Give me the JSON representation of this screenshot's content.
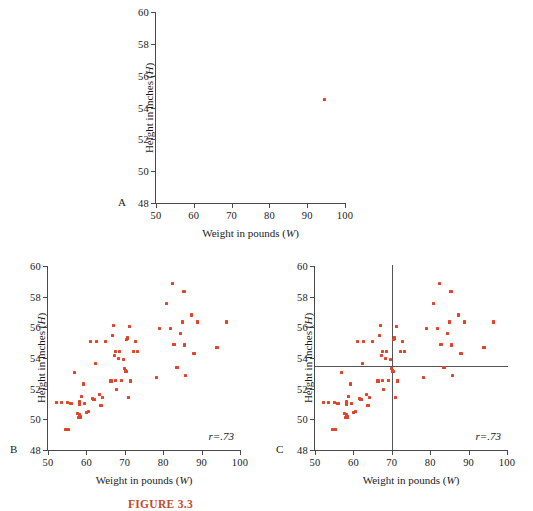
{
  "figure": {
    "caption": "FIGURE 3.3",
    "point_color": "#e0452a",
    "axis_color": "#4a4a4a",
    "line_color": "#55545a"
  },
  "chart_data": [
    {
      "type": "scatter",
      "panel": "A",
      "title": "",
      "xlabel": "Weight in pounds (W)",
      "ylabel": "Height in inches (H)",
      "xlim": [
        50,
        100
      ],
      "ylim": [
        48,
        60
      ],
      "xticks": [
        50,
        60,
        70,
        80,
        90,
        100
      ],
      "yticks": [
        48,
        50,
        52,
        54,
        56,
        58,
        60
      ],
      "grid": false,
      "legend": "none",
      "annotation": "",
      "points": [
        [
          94.5,
          54.5
        ]
      ]
    },
    {
      "type": "scatter",
      "panel": "B",
      "title": "",
      "xlabel": "Weight in pounds (W)",
      "ylabel": "Height in inches (H)",
      "xlim": [
        50,
        100
      ],
      "ylim": [
        48,
        60
      ],
      "xticks": [
        50,
        60,
        70,
        80,
        90,
        100
      ],
      "yticks": [
        48,
        50,
        52,
        54,
        56,
        58,
        60
      ],
      "grid": false,
      "legend": "none",
      "annotation": "r=.73",
      "correlation": 0.73,
      "points": [
        [
          52.3,
          51.1
        ],
        [
          53.6,
          51.1
        ],
        [
          54.7,
          49.35
        ],
        [
          55.4,
          49.35
        ],
        [
          55.0,
          51.1
        ],
        [
          56.0,
          51.05
        ],
        [
          57.0,
          53.05
        ],
        [
          57.6,
          50.4
        ],
        [
          58.0,
          50.1
        ],
        [
          58.1,
          50.3
        ],
        [
          58.2,
          51.0
        ],
        [
          58.3,
          51.15
        ],
        [
          58.5,
          50.15
        ],
        [
          58.8,
          51.5
        ],
        [
          59.3,
          52.3
        ],
        [
          59.6,
          51.05
        ],
        [
          60.0,
          50.45
        ],
        [
          60.6,
          50.5
        ],
        [
          61.0,
          55.1
        ],
        [
          61.5,
          51.35
        ],
        [
          62.0,
          51.3
        ],
        [
          62.3,
          53.65
        ],
        [
          62.6,
          55.1
        ],
        [
          63.4,
          51.6
        ],
        [
          63.8,
          50.9
        ],
        [
          64.2,
          51.45
        ],
        [
          65.0,
          55.1
        ],
        [
          66.4,
          52.5
        ],
        [
          66.7,
          55.45
        ],
        [
          67.1,
          56.1
        ],
        [
          67.3,
          54.15
        ],
        [
          67.5,
          52.55
        ],
        [
          67.6,
          54.4
        ],
        [
          67.9,
          51.95
        ],
        [
          68.3,
          53.95
        ],
        [
          68.6,
          54.45
        ],
        [
          69.2,
          52.55
        ],
        [
          69.7,
          53.9
        ],
        [
          70.0,
          53.3
        ],
        [
          70.2,
          53.15
        ],
        [
          70.3,
          53.1
        ],
        [
          70.5,
          55.2
        ],
        [
          70.7,
          55.3
        ],
        [
          70.9,
          51.4
        ],
        [
          71.2,
          56.05
        ],
        [
          71.4,
          52.5
        ],
        [
          72.2,
          54.45
        ],
        [
          72.8,
          55.1
        ],
        [
          73.3,
          54.45
        ],
        [
          78.3,
          52.75
        ],
        [
          79.0,
          55.95
        ],
        [
          80.8,
          57.55
        ],
        [
          82.0,
          55.95
        ],
        [
          82.5,
          58.85
        ],
        [
          82.8,
          54.9
        ],
        [
          83.6,
          53.4
        ],
        [
          84.4,
          55.6
        ],
        [
          85.0,
          56.35
        ],
        [
          85.4,
          58.35
        ],
        [
          85.6,
          54.85
        ],
        [
          85.9,
          52.85
        ],
        [
          87.4,
          56.8
        ],
        [
          88.0,
          54.3
        ],
        [
          89.0,
          56.35
        ],
        [
          94.0,
          54.7
        ],
        [
          96.4,
          56.35
        ]
      ]
    },
    {
      "type": "scatter",
      "panel": "C",
      "title": "",
      "xlabel": "Weight in pounds (W)",
      "ylabel": "Height in inches (H)",
      "xlim": [
        50,
        100
      ],
      "ylim": [
        48,
        60
      ],
      "xticks": [
        50,
        60,
        70,
        80,
        90,
        100
      ],
      "yticks": [
        48,
        50,
        52,
        54,
        56,
        58,
        60
      ],
      "grid": false,
      "legend": "none",
      "annotation": "r=.73",
      "correlation": 0.73,
      "reference_lines": {
        "vertical_x": 70,
        "horizontal_y": 53.5
      },
      "points": [
        [
          52.3,
          51.1
        ],
        [
          53.6,
          51.1
        ],
        [
          54.7,
          49.35
        ],
        [
          55.4,
          49.35
        ],
        [
          55.0,
          51.1
        ],
        [
          56.0,
          51.05
        ],
        [
          57.0,
          53.05
        ],
        [
          57.6,
          50.4
        ],
        [
          58.0,
          50.1
        ],
        [
          58.1,
          50.3
        ],
        [
          58.2,
          51.0
        ],
        [
          58.3,
          51.15
        ],
        [
          58.5,
          50.15
        ],
        [
          58.8,
          51.5
        ],
        [
          59.3,
          52.3
        ],
        [
          59.6,
          51.05
        ],
        [
          60.0,
          50.45
        ],
        [
          60.6,
          50.5
        ],
        [
          61.0,
          55.1
        ],
        [
          61.5,
          51.35
        ],
        [
          62.0,
          51.3
        ],
        [
          62.3,
          53.65
        ],
        [
          62.6,
          55.1
        ],
        [
          63.4,
          51.6
        ],
        [
          63.8,
          50.9
        ],
        [
          64.2,
          51.45
        ],
        [
          65.0,
          55.1
        ],
        [
          66.4,
          52.5
        ],
        [
          66.7,
          55.45
        ],
        [
          67.1,
          56.1
        ],
        [
          67.3,
          54.15
        ],
        [
          67.5,
          52.55
        ],
        [
          67.6,
          54.4
        ],
        [
          67.9,
          51.95
        ],
        [
          68.3,
          53.95
        ],
        [
          68.6,
          54.45
        ],
        [
          69.2,
          52.55
        ],
        [
          69.7,
          53.9
        ],
        [
          70.0,
          53.3
        ],
        [
          70.2,
          53.15
        ],
        [
          70.3,
          53.1
        ],
        [
          70.5,
          55.2
        ],
        [
          70.7,
          55.3
        ],
        [
          70.9,
          51.4
        ],
        [
          71.2,
          56.05
        ],
        [
          71.4,
          52.5
        ],
        [
          72.2,
          54.45
        ],
        [
          72.8,
          55.1
        ],
        [
          73.3,
          54.45
        ],
        [
          78.3,
          52.75
        ],
        [
          79.0,
          55.95
        ],
        [
          80.8,
          57.55
        ],
        [
          82.0,
          55.95
        ],
        [
          82.5,
          58.85
        ],
        [
          82.8,
          54.9
        ],
        [
          83.6,
          53.4
        ],
        [
          84.4,
          55.6
        ],
        [
          85.0,
          56.35
        ],
        [
          85.4,
          58.35
        ],
        [
          85.6,
          54.85
        ],
        [
          85.9,
          52.85
        ],
        [
          87.4,
          56.8
        ],
        [
          88.0,
          54.3
        ],
        [
          89.0,
          56.35
        ],
        [
          94.0,
          54.7
        ],
        [
          96.4,
          56.35
        ]
      ]
    }
  ],
  "panels": {
    "a": {
      "letter": "A"
    },
    "b": {
      "letter": "B"
    },
    "c": {
      "letter": "C"
    }
  }
}
